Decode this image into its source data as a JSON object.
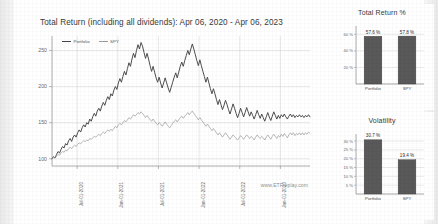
{
  "main": {
    "title": "Total Return (including all dividends): Apr 06, 2020 - Apr 06, 2023",
    "watermark": "www.ETFreplay.com",
    "legend": [
      {
        "label": "Portfolio",
        "color": "#444444"
      },
      {
        "label": "SPY",
        "color": "#9a9a9a"
      }
    ]
  },
  "panels": {
    "total_return_title": "Total Return %",
    "volatility_title": "Volatility"
  },
  "colors": {
    "portfolio_line": "#444444",
    "spy_line": "#9a9a9a",
    "bar_fill": "#595959",
    "grid": "#d8d8d8",
    "axis": "#9b9b9b",
    "text": "#3a3a3a"
  },
  "chart_data": [
    {
      "type": "line",
      "title": "Total Return (including all dividends): Apr 06, 2020 - Apr 06, 2023",
      "xlabel": "",
      "ylabel": "",
      "ylim": [
        90,
        270
      ],
      "yticks": [
        100,
        150,
        200,
        250
      ],
      "ytick_labels": [
        "100",
        "150",
        "200",
        "250"
      ],
      "xticks": [
        "Jul-01-2020",
        "Jan-01-2021",
        "Jul-01-2021",
        "Jan-01-2022",
        "Jul-01-2022",
        "Jan-01-2023"
      ],
      "grid": true,
      "legend_position": "top-left",
      "annotation": "www.ETFreplay.com",
      "series": [
        {
          "name": "Portfolio",
          "color": "#444444",
          "values": [
            100,
            103,
            101,
            106,
            110,
            108,
            113,
            117,
            115,
            121,
            119,
            125,
            128,
            124,
            130,
            133,
            130,
            136,
            140,
            137,
            143,
            147,
            144,
            150,
            148,
            155,
            152,
            158,
            163,
            159,
            166,
            170,
            166,
            173,
            178,
            174,
            181,
            186,
            182,
            190,
            187,
            195,
            200,
            196,
            205,
            211,
            206,
            214,
            221,
            216,
            225,
            233,
            228,
            238,
            246,
            240,
            250,
            258,
            252,
            261,
            256,
            247,
            239,
            246,
            238,
            229,
            221,
            228,
            220,
            212,
            206,
            213,
            205,
            198,
            205,
            212,
            205,
            198,
            192,
            199,
            206,
            213,
            219,
            212,
            220,
            228,
            234,
            228,
            236,
            243,
            250,
            244,
            252,
            259,
            252,
            244,
            236,
            229,
            237,
            229,
            221,
            214,
            206,
            213,
            205,
            197,
            190,
            197,
            190,
            182,
            175,
            182,
            175,
            168,
            174,
            181,
            175,
            168,
            162,
            169,
            176,
            170,
            163,
            157,
            163,
            170,
            164,
            158,
            164,
            171,
            165,
            159,
            165,
            160,
            155,
            161,
            167,
            161,
            156,
            162,
            157,
            152,
            158,
            164,
            158,
            153,
            159,
            165,
            160,
            155,
            160,
            156,
            161,
            158,
            162,
            158,
            155,
            159,
            162,
            158,
            161,
            157,
            160,
            158,
            161,
            158,
            160,
            157,
            160,
            158,
            161,
            158
          ]
        },
        {
          "name": "SPY",
          "color": "#9a9a9a",
          "values": [
            100,
            102,
            101,
            104,
            106,
            105,
            108,
            110,
            109,
            112,
            111,
            114,
            116,
            114,
            117,
            119,
            117,
            120,
            122,
            121,
            123,
            125,
            124,
            126,
            125,
            128,
            127,
            129,
            131,
            130,
            132,
            134,
            132,
            135,
            137,
            135,
            138,
            140,
            138,
            141,
            139,
            142,
            145,
            143,
            147,
            149,
            147,
            150,
            153,
            151,
            154,
            157,
            155,
            158,
            161,
            159,
            161,
            164,
            162,
            165,
            163,
            160,
            157,
            160,
            157,
            154,
            152,
            155,
            152,
            149,
            147,
            150,
            148,
            145,
            148,
            151,
            148,
            145,
            143,
            146,
            149,
            152,
            154,
            151,
            154,
            157,
            159,
            156,
            159,
            161,
            164,
            161,
            164,
            166,
            163,
            160,
            157,
            154,
            157,
            154,
            151,
            148,
            145,
            148,
            145,
            142,
            139,
            142,
            139,
            136,
            133,
            136,
            133,
            130,
            133,
            136,
            133,
            130,
            127,
            130,
            133,
            131,
            128,
            126,
            129,
            132,
            130,
            127,
            130,
            133,
            131,
            128,
            131,
            129,
            126,
            130,
            133,
            130,
            128,
            131,
            129,
            126,
            130,
            133,
            130,
            127,
            131,
            134,
            131,
            128,
            132,
            130,
            134,
            131,
            135,
            132,
            129,
            133,
            136,
            133,
            136,
            132,
            135,
            133,
            136,
            133,
            136,
            133,
            136,
            134,
            137,
            135
          ]
        }
      ]
    },
    {
      "type": "bar",
      "title": "Total Return %",
      "categories": [
        "Portfolio",
        "SPY"
      ],
      "values": [
        57.6,
        57.8
      ],
      "value_labels": [
        "57.6 %",
        "57.8 %"
      ],
      "ylim": [
        0,
        70
      ],
      "yticks": [
        20,
        40,
        60
      ],
      "ytick_labels": [
        "20 %",
        "40 %",
        "60 %"
      ],
      "grid": true,
      "ylabel": "",
      "xlabel": ""
    },
    {
      "type": "bar",
      "title": "Volatility",
      "categories": [
        "Portfolio",
        "SPY"
      ],
      "values": [
        30.7,
        19.4
      ],
      "value_labels": [
        "30.7 %",
        "19.4 %"
      ],
      "ylim": [
        0,
        34
      ],
      "yticks": [
        5,
        10,
        15,
        20,
        25,
        30
      ],
      "ytick_labels": [
        "5 %",
        "10 %",
        "15 %",
        "20 %",
        "25 %",
        "30 %"
      ],
      "grid": true,
      "ylabel": "",
      "xlabel": ""
    }
  ]
}
